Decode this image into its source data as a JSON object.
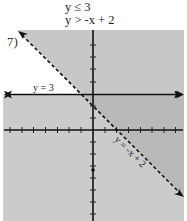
{
  "problem": {
    "number": "7)",
    "inequalities": [
      "y ≤ 3",
      "y > -x + 2"
    ]
  },
  "graph": {
    "boundary_lines": [
      {
        "equation": "y = 3",
        "label": "y = 3",
        "style": "solid"
      },
      {
        "equation": "y = -x + 2",
        "label": "y = -x + 2",
        "style": "dashed"
      }
    ],
    "x_range": [
      -7,
      7
    ],
    "y_range": [
      -7,
      8
    ],
    "tick_spacing": 1,
    "solution_region": "below y = 3 and above y = -x + 2",
    "colors": {
      "background": "#ffffff",
      "shade_light": "#cbcbcb",
      "shade_overlap": "#b9b9b9",
      "axis": "#111111"
    }
  }
}
